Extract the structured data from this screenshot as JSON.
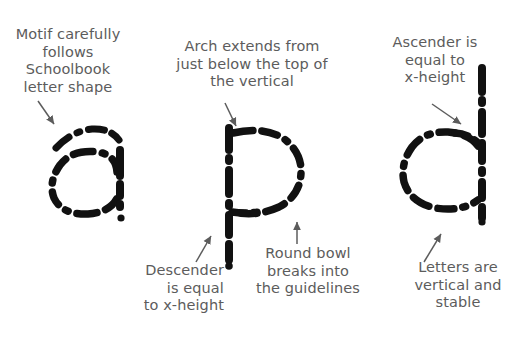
{
  "page": {
    "background_color": "#ffffff",
    "ink_color": "#111111",
    "caption_color": "#5c5c5c",
    "width": 526,
    "height": 341
  },
  "captions": [
    {
      "id": "motif",
      "name": "caption-motif-follows-schoolbook",
      "text": "Motif carefully\nfollows\nSchoolbook\nletter shape",
      "align": "center",
      "points_to": "letter-a"
    },
    {
      "id": "arch",
      "name": "caption-arch-extends",
      "text": "Arch extends from\njust below the top of\nthe vertical",
      "align": "center",
      "points_to": "letter-p"
    },
    {
      "id": "ascender",
      "name": "caption-ascender-equal-x-height",
      "text": "Ascender is\nequal to\nx-height",
      "align": "center",
      "points_to": "letter-d"
    },
    {
      "id": "descender",
      "name": "caption-descender-equal-x-height",
      "text": "Descender\nis equal\nto x-height",
      "align": "right",
      "points_to": "letter-p"
    },
    {
      "id": "roundbowl",
      "name": "caption-round-bowl-breaks",
      "text": "Round bowl\nbreaks into\nthe guidelines",
      "align": "center",
      "points_to": "letter-p"
    },
    {
      "id": "vertical",
      "name": "caption-letters-vertical-stable",
      "text": "Letters are\nvertical and\nstable",
      "align": "center",
      "points_to": "letter-d"
    }
  ],
  "letters": [
    {
      "id": "a",
      "name": "letter-a",
      "character": "a",
      "style": "dotted-dashed-stroke"
    },
    {
      "id": "p",
      "name": "letter-p",
      "character": "p",
      "style": "dotted-dashed-stroke"
    },
    {
      "id": "d",
      "name": "letter-d",
      "character": "d",
      "style": "dotted-dashed-stroke"
    }
  ],
  "arrows": [
    {
      "id": "arrow-motif",
      "name": "arrow-to-letter-a",
      "direction": "down-right"
    },
    {
      "id": "arrow-arch",
      "name": "arrow-to-letter-p-arch",
      "direction": "down-right"
    },
    {
      "id": "arrow-ascender",
      "name": "arrow-to-letter-d-ascender",
      "direction": "down-right"
    },
    {
      "id": "arrow-descender",
      "name": "arrow-to-letter-p-descender",
      "direction": "up-right"
    },
    {
      "id": "arrow-roundbowl",
      "name": "arrow-to-letter-p-bowl",
      "direction": "up"
    },
    {
      "id": "arrow-vertical",
      "name": "arrow-to-letter-d-stem",
      "direction": "up-right"
    }
  ]
}
